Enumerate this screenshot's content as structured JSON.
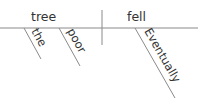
{
  "diagram": {
    "type": "Reed-Kellogg sentence diagram",
    "subject": "tree",
    "predicate": "fell",
    "modifiers": {
      "subject": [
        "the",
        "poor"
      ],
      "predicate": [
        "Eventually"
      ]
    }
  },
  "labels": {
    "subject": "tree",
    "predicate": "fell",
    "mod_the": "the",
    "mod_poor": "poor",
    "mod_eventually": "Eventually"
  },
  "colors": {
    "line": "#8a8a8a",
    "text": "#333333",
    "background": "#ffffff"
  }
}
